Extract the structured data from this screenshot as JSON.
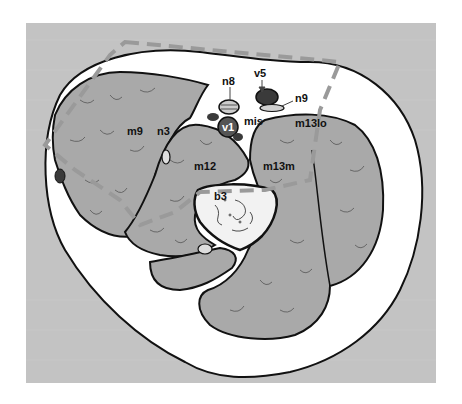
{
  "figure": {
    "background_color": "#c3c3c3",
    "muscle_fill": "#a9a9a9",
    "skin_fill": "#ffffff",
    "outline_color": "#111111",
    "dashed_line_color": "#9a9a9a",
    "vessel_dark": "#3a3a3a"
  },
  "labels": {
    "n8": "n8",
    "v5": "v5",
    "n9": "n9",
    "v1": "v1",
    "mis": "mis",
    "m13lo": "m13lo",
    "m9": "m9",
    "n3": "n3",
    "m12": "m12",
    "m13m": "m13m",
    "b3": "b3"
  }
}
